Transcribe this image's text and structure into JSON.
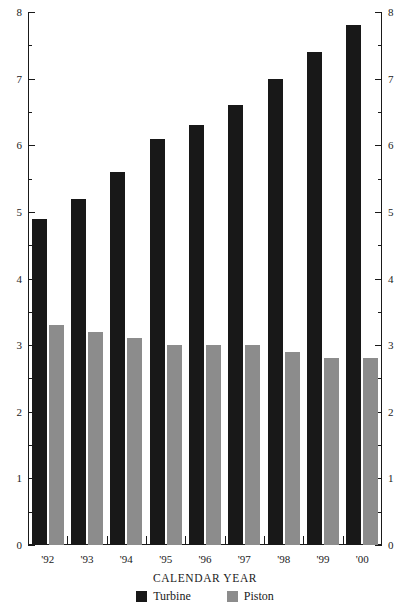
{
  "chart_data": {
    "type": "bar",
    "title": "",
    "xlabel": "CALENDAR YEAR",
    "ylabel": "",
    "categories": [
      "'92",
      "'93",
      "'94",
      "'95",
      "'96",
      "'97",
      "'98",
      "'99",
      "'00"
    ],
    "series": [
      {
        "name": "Turbine",
        "color": "#181818",
        "values": [
          4.9,
          5.2,
          5.6,
          6.1,
          6.3,
          6.6,
          7.0,
          7.4,
          7.8
        ]
      },
      {
        "name": "Piston",
        "color": "#8c8c8c",
        "values": [
          3.3,
          3.2,
          3.1,
          3.0,
          3.0,
          3.0,
          2.9,
          2.8,
          2.8
        ]
      }
    ],
    "ylim": [
      0,
      8
    ],
    "y_ticks": [
      0,
      1,
      2,
      3,
      4,
      5,
      6,
      7,
      8
    ],
    "y_tick_labels": [
      "0",
      "1",
      "2",
      "3",
      "4",
      "5",
      "6",
      "7",
      "8"
    ],
    "y_minor_ticks": [
      0.5,
      1.5,
      2.5,
      3.5,
      4.5,
      5.5,
      6.5,
      7.5
    ],
    "grid": false,
    "dual_y_axis": true,
    "legend_position": "bottom",
    "legend": [
      "Turbine",
      "Piston"
    ]
  },
  "colors": {
    "turbine": "#181818",
    "piston": "#8c8c8c",
    "axis": "#1a1a1a",
    "background": "#ffffff"
  }
}
